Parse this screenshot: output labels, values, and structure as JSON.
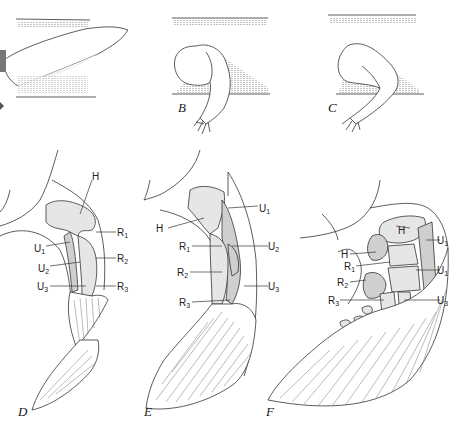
{
  "figure": {
    "panels": [
      {
        "id": "A",
        "label": "A",
        "description": "flipper/limb resting flat against body surface"
      },
      {
        "id": "B",
        "label": "B",
        "description": "limb partially folded with frayed tip"
      },
      {
        "id": "C",
        "label": "C",
        "description": "limb folded into V-shape with frayed tip"
      },
      {
        "id": "D",
        "label": "D",
        "description": "skeletal dissection with labelled bones",
        "bone_labels": [
          "H",
          "R1",
          "U1",
          "R2",
          "U2",
          "U3",
          "R3"
        ]
      },
      {
        "id": "E",
        "label": "E",
        "description": "skeletal dissection with labelled bones",
        "bone_labels": [
          "U1",
          "H",
          "R1",
          "U2",
          "R2",
          "U3",
          "R3"
        ]
      },
      {
        "id": "F",
        "label": "F",
        "description": "skeletal dissection with labelled bones",
        "bone_labels": [
          "H",
          "U1",
          "H",
          "R1",
          "U1",
          "R2",
          "R3",
          "U3"
        ]
      }
    ]
  },
  "labels": {
    "B": "B",
    "C": "C",
    "D": "D",
    "E": "E",
    "F": "F",
    "A_partial": "A",
    "H": "H",
    "R": "R",
    "U": "U",
    "s1": "1",
    "s2": "2",
    "s3": "3"
  },
  "colors": {
    "ink": "#333333",
    "bone_fill": "#e6e6e6",
    "bone_shade": "#cfcfcf",
    "background": "#ffffff"
  }
}
